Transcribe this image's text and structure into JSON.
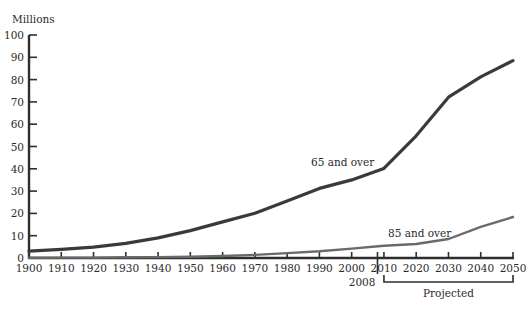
{
  "chart_data": {
    "type": "line",
    "title": "",
    "ylabel": "Millions",
    "xlabel": "",
    "ylim": [
      0,
      100
    ],
    "xlim": [
      1900,
      2050
    ],
    "grid": false,
    "legend": "inline labels",
    "y_ticks": [
      0,
      10,
      20,
      30,
      40,
      50,
      60,
      70,
      80,
      90,
      100
    ],
    "x_ticks": [
      1900,
      1910,
      1920,
      1930,
      1940,
      1950,
      1960,
      1970,
      1980,
      1990,
      2000,
      2010,
      2020,
      2030,
      2040,
      2050
    ],
    "x": [
      1900,
      1910,
      1920,
      1930,
      1940,
      1950,
      1960,
      1970,
      1980,
      1990,
      2000,
      2010,
      2020,
      2030,
      2040,
      2050
    ],
    "series": [
      {
        "name": "65 and over",
        "color": "#3a3a3a",
        "stroke_width": 3.2,
        "values": [
          3.1,
          3.9,
          4.9,
          6.6,
          9.0,
          12.3,
          16.2,
          20.1,
          25.5,
          31.2,
          35.0,
          40.2,
          54.8,
          72.1,
          81.2,
          88.5
        ],
        "label_position": {
          "x": 311,
          "y": 166
        }
      },
      {
        "name": "85 and over",
        "color": "#6a6a6a",
        "stroke_width": 2.4,
        "values": [
          0.1,
          0.2,
          0.2,
          0.3,
          0.4,
          0.6,
          0.9,
          1.4,
          2.2,
          3.0,
          4.2,
          5.5,
          6.3,
          8.5,
          14.0,
          18.4
        ],
        "label_position": {
          "x": 388,
          "y": 237
        }
      }
    ],
    "annotations": [
      {
        "type": "vertical-marker",
        "x": 2008,
        "label": "2008"
      },
      {
        "type": "bracket",
        "from": 2010,
        "to": 2050,
        "label": "Projected"
      }
    ]
  }
}
